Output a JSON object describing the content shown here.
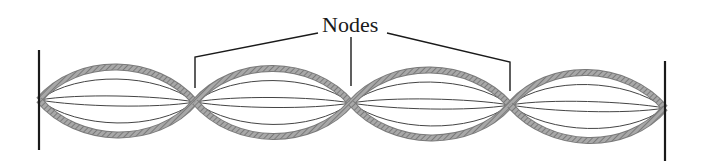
{
  "diagram": {
    "label": "Nodes",
    "num_segments": 4,
    "colors": {
      "rope": "#9a9a9a",
      "rope_hatch": "#6e6e6e",
      "thin_lines": "#444444",
      "walls": "#1a1a1a",
      "leaders": "#1a1a1a"
    },
    "walls": [
      {
        "x": 39,
        "y1": 50,
        "y2": 150
      },
      {
        "x": 665,
        "y1": 61,
        "y2": 161
      }
    ],
    "nodes": [
      {
        "x": 39,
        "y": 100
      },
      {
        "x": 195,
        "y": 102
      },
      {
        "x": 351,
        "y": 103
      },
      {
        "x": 510,
        "y": 105
      },
      {
        "x": 665,
        "y": 108
      }
    ],
    "amplitudes": {
      "outer": 34,
      "inner": [
        22,
        5
      ]
    },
    "leaders": [
      {
        "points": "318,33 195,57 195,88"
      },
      {
        "points": "351,37 351,86"
      },
      {
        "points": "387,33 510,62 510,91"
      }
    ]
  }
}
